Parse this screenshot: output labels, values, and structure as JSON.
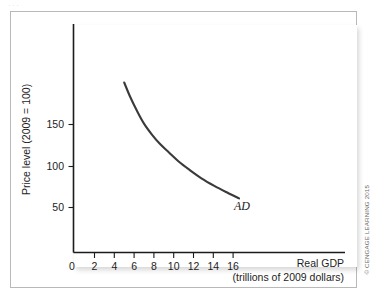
{
  "figure": {
    "top_artifact_text": "...",
    "copyright": "© CENGAGE LEARNING 2015",
    "curve_label": "AD"
  },
  "chart_data": {
    "type": "line",
    "title": "",
    "subtitle": "",
    "xlabel": "Real GDP",
    "xlabel_sub": "(trillions of 2009 dollars)",
    "ylabel": "Price level (2009 = 100)",
    "xlim": [
      0,
      18
    ],
    "ylim": [
      0,
      225
    ],
    "grid": false,
    "legend": "none",
    "x_ticks": [
      0,
      2,
      4,
      6,
      8,
      10,
      12,
      14,
      16
    ],
    "x_tick_labels": [
      "0",
      "2",
      "4",
      "6",
      "8",
      "10",
      "12",
      "14",
      "16"
    ],
    "y_ticks": [
      50,
      100,
      150
    ],
    "y_tick_labels": [
      "50",
      "100",
      "150"
    ],
    "series": [
      {
        "name": "AD",
        "annotation": "AD",
        "x": [
          5.0,
          5.6,
          6.3,
          7.0,
          7.8,
          8.6,
          9.5,
          10.5,
          11.6,
          12.8,
          14.1,
          15.4,
          16.6
        ],
        "y": [
          200,
          183,
          166,
          151,
          138,
          127,
          117,
          106,
          96,
          86,
          77,
          69,
          62
        ]
      }
    ]
  }
}
